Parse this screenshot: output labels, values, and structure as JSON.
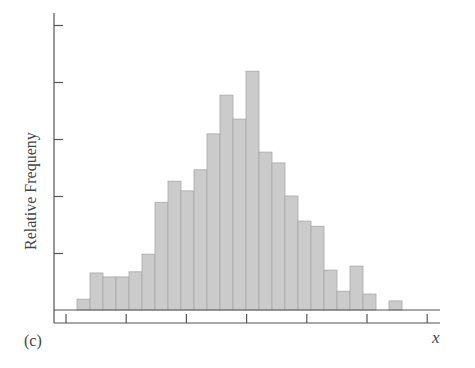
{
  "panel_label": "(c)",
  "chart_data": {
    "type": "bar",
    "subtype": "histogram",
    "title": "",
    "xlabel": "x",
    "ylabel": "Relative Frequeny",
    "panel": "(c)",
    "grid": false,
    "legend": null,
    "y_tick_count": 5,
    "x_tick_count": 7,
    "x_tick_labels": [],
    "y_tick_labels": [],
    "units_note": "Heights in y-tick units (unlabeled axis; one tick spacing = 1.0)",
    "bin_count": 25,
    "values": [
      0.19,
      0.65,
      0.58,
      0.58,
      0.67,
      0.98,
      1.89,
      2.26,
      2.09,
      2.46,
      3.09,
      3.77,
      3.35,
      4.19,
      2.77,
      2.58,
      2.0,
      1.56,
      1.47,
      0.7,
      0.33,
      0.77,
      0.28,
      0.0,
      0.16
    ],
    "ylim": [
      0,
      5.2
    ]
  }
}
